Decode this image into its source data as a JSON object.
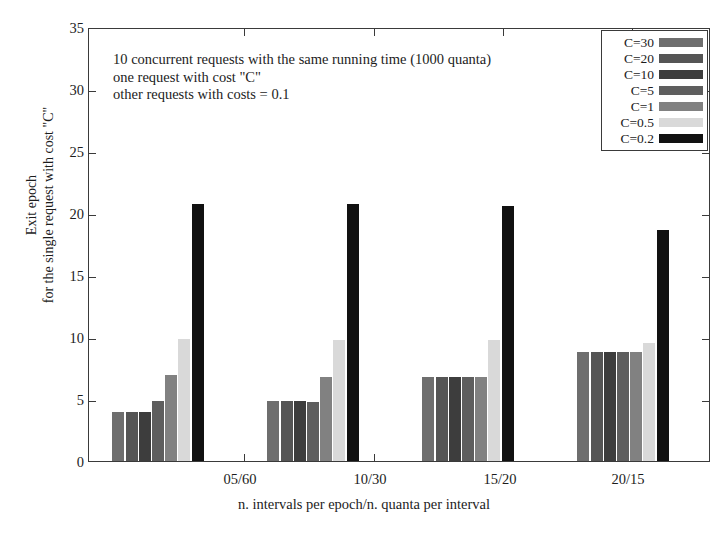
{
  "chart_data": {
    "type": "bar",
    "title": "",
    "xlabel": "n. intervals per epoch/n. quanta per interval",
    "ylabel_line1": "Exit epoch",
    "ylabel_line2": "for the single request with cost \"C\"",
    "categories": [
      "05/60",
      "10/30",
      "15/20",
      "20/15"
    ],
    "ylim": [
      0,
      35
    ],
    "yticks": [
      0,
      5,
      10,
      15,
      20,
      25,
      30,
      35
    ],
    "ytick_labels": [
      "0",
      "5",
      "10",
      "15",
      "20",
      "25",
      "30",
      "35"
    ],
    "grid": false,
    "legend_position": "top-right",
    "series": [
      {
        "name": "C=30",
        "color": "#6e6e6e",
        "values": [
          4.0,
          4.9,
          6.8,
          8.8
        ]
      },
      {
        "name": "C=20",
        "color": "#555555",
        "values": [
          4.0,
          4.9,
          6.8,
          8.8
        ]
      },
      {
        "name": "C=10",
        "color": "#3d3d3d",
        "values": [
          4.0,
          4.9,
          6.8,
          8.8
        ]
      },
      {
        "name": "C=5",
        "color": "#5e5e5e",
        "values": [
          4.9,
          4.8,
          6.8,
          8.8
        ]
      },
      {
        "name": "C=1",
        "color": "#818181",
        "values": [
          7.0,
          6.8,
          6.8,
          8.8
        ]
      },
      {
        "name": "C=0.5",
        "color": "#d9d9d9",
        "values": [
          9.9,
          9.8,
          9.8,
          9.6
        ]
      },
      {
        "name": "C=0.2",
        "color": "#111111",
        "values": [
          20.8,
          20.8,
          20.7,
          18.7
        ]
      }
    ],
    "annotation": {
      "line1": "10 concurrent requests with the same running time (1000 quanta)",
      "line2": "one request with cost \"C\"",
      "line3": "other requests with costs = 0.1"
    }
  },
  "legend": {
    "items": [
      {
        "label": "C=30"
      },
      {
        "label": "C=20"
      },
      {
        "label": "C=10"
      },
      {
        "label": "C=5"
      },
      {
        "label": "C=1"
      },
      {
        "label": "C=0.5"
      },
      {
        "label": "C=0.2"
      }
    ]
  },
  "axes": {
    "y_tick_0": "0",
    "y_tick_1": "5",
    "y_tick_2": "10",
    "y_tick_3": "15",
    "y_tick_4": "20",
    "y_tick_5": "25",
    "y_tick_6": "30",
    "y_tick_7": "35",
    "x_tick_0": "05/60",
    "x_tick_1": "10/30",
    "x_tick_2": "15/20",
    "x_tick_3": "20/15"
  }
}
